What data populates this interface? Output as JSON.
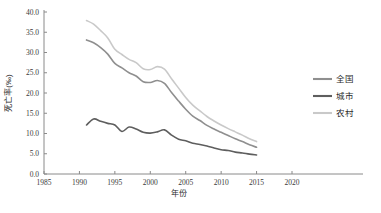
{
  "chart_data": {
    "type": "line",
    "title": "",
    "xlabel": "年份",
    "ylabel": "死亡率(‰)",
    "xlim": [
      1985,
      2020
    ],
    "ylim": [
      0.0,
      40.0
    ],
    "xticks": [
      "1985",
      "1990",
      "1995",
      "2000",
      "2005",
      "2010",
      "2015",
      "2020"
    ],
    "yticks": [
      "0.0",
      "5.0",
      "10.0",
      "15.0",
      "20.0",
      "25.0",
      "30.0",
      "35.0",
      "40.0"
    ],
    "grid": false,
    "legend_position": "right",
    "x": [
      1991,
      1992,
      1993,
      1994,
      1995,
      1996,
      1997,
      1998,
      1999,
      2000,
      2001,
      2002,
      2003,
      2004,
      2005,
      2006,
      2007,
      2008,
      2009,
      2010,
      2011,
      2012,
      2013,
      2014,
      2015
    ],
    "series": [
      {
        "name": "全国",
        "color": "#8f8f8f",
        "values": [
          33.1,
          32.4,
          31.2,
          29.6,
          27.3,
          26.2,
          25.0,
          24.2,
          22.8,
          22.6,
          23.1,
          22.4,
          20.1,
          18.0,
          16.0,
          14.3,
          13.2,
          12.0,
          11.1,
          10.3,
          9.5,
          8.7,
          8.0,
          7.2,
          6.6
        ]
      },
      {
        "name": "城市",
        "color": "#5e5e5e",
        "values": [
          12.1,
          13.6,
          13.0,
          12.5,
          12.1,
          10.5,
          11.6,
          11.1,
          10.3,
          10.1,
          10.4,
          10.9,
          9.6,
          8.6,
          8.2,
          7.6,
          7.3,
          6.9,
          6.4,
          6.0,
          5.8,
          5.4,
          5.2,
          4.9,
          4.7
        ]
      },
      {
        "name": "农村",
        "color": "#c9c9c9",
        "values": [
          37.9,
          37.0,
          35.4,
          33.6,
          30.8,
          29.5,
          28.3,
          27.5,
          26.0,
          25.8,
          26.5,
          25.9,
          23.5,
          21.2,
          18.9,
          17.0,
          15.6,
          14.2,
          13.1,
          12.1,
          11.2,
          10.4,
          9.6,
          8.7,
          8.0
        ]
      }
    ]
  },
  "legend": {
    "items": [
      {
        "label": "全国",
        "color": "#8f8f8f"
      },
      {
        "label": "城市",
        "color": "#5e5e5e"
      },
      {
        "label": "农村",
        "color": "#c9c9c9"
      }
    ]
  }
}
